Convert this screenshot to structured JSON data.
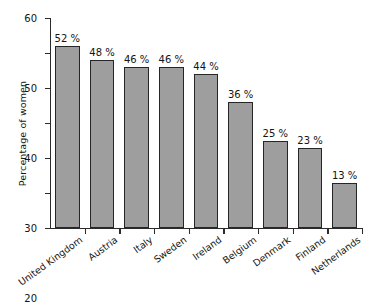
{
  "chart_data": {
    "type": "bar",
    "title": "",
    "xlabel": "",
    "ylabel": "Percentage of women",
    "categories": [
      "United Kingdom",
      "Austria",
      "Italy",
      "Sweden",
      "Ireland",
      "Belgium",
      "Denmark",
      "Finland",
      "Netherlands"
    ],
    "values": [
      52,
      48,
      46,
      46,
      44,
      36,
      25,
      23,
      13
    ],
    "data_labels": [
      "52 %",
      "48 %",
      "46 %",
      "46 %",
      "44 %",
      "36 %",
      "25 %",
      "23 %",
      "13 %"
    ],
    "ylim": [
      0,
      60
    ],
    "yticks": [
      0,
      10,
      20,
      30,
      40,
      50,
      60
    ],
    "ytick_labels": [
      "0",
      "10",
      "20",
      "30",
      "40",
      "50",
      "60"
    ],
    "grid": false,
    "legend": "none",
    "bar_color": "#9e9e9e",
    "bar_edge_color": "#262626",
    "axis_color": "#2b2b2b",
    "text_color": "#141414"
  }
}
